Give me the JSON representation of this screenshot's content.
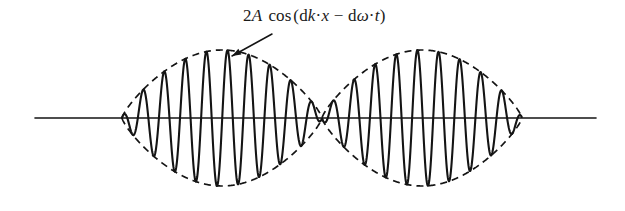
{
  "figure": {
    "background_color": "#ffffff",
    "ink_color": "#141414",
    "width": 625,
    "height": 211
  },
  "annotation": {
    "name": "envelope-formula",
    "full_text": "2A cos (dk·x − dω·t)",
    "parts": {
      "amplitude": "2",
      "amplitude_symbol": "A",
      "function": "cos",
      "open_paren": "(",
      "d_one": "d",
      "k_symbol": "k",
      "dot_one": "·",
      "x_symbol": "x",
      "minus": "−",
      "d_two": "d",
      "omega_symbol": "ω",
      "dot_two": "·",
      "t_symbol": "t",
      "close_paren": ")"
    },
    "leader": {
      "type": "arrow",
      "from_x": 272,
      "from_y": 34,
      "to_x": 232,
      "to_y": 56,
      "points_to": "upper-dashed-envelope"
    }
  },
  "axis": {
    "name": "horizontal-axis",
    "y": 118,
    "x_start": 35,
    "x_end": 596,
    "stroke_width": 1.6,
    "color": "#141414"
  },
  "chart_data": {
    "type": "line",
    "xlabel": "",
    "ylabel": "",
    "grid": false,
    "legend": null,
    "axis_y_pixel": 118,
    "xlim": [
      35,
      596
    ],
    "ylim": [
      -1,
      1
    ],
    "series": [
      {
        "name": "carrier-wave",
        "style": "solid",
        "color": "#141414",
        "stroke_width": 2.0,
        "carrier_cycles_per_packet": 9.5,
        "carrier_wavelength_px": 21.1,
        "amplitude_peak_px": 68
      },
      {
        "name": "upper-envelope",
        "style": "dashed",
        "color": "#141414",
        "stroke_width": 1.6,
        "dash_pattern": "7,5"
      },
      {
        "name": "lower-envelope",
        "style": "dashed",
        "color": "#141414",
        "stroke_width": 1.6,
        "dash_pattern": "7,5"
      }
    ],
    "envelope": {
      "nodes_x": [
        122,
        322,
        522
      ],
      "antinodes_x": [
        222,
        422
      ],
      "top_peak_y": 50,
      "bottom_peak_y": 186,
      "packet_width_px": 200,
      "packet_count": 2,
      "shape": "cosine-lens"
    }
  }
}
